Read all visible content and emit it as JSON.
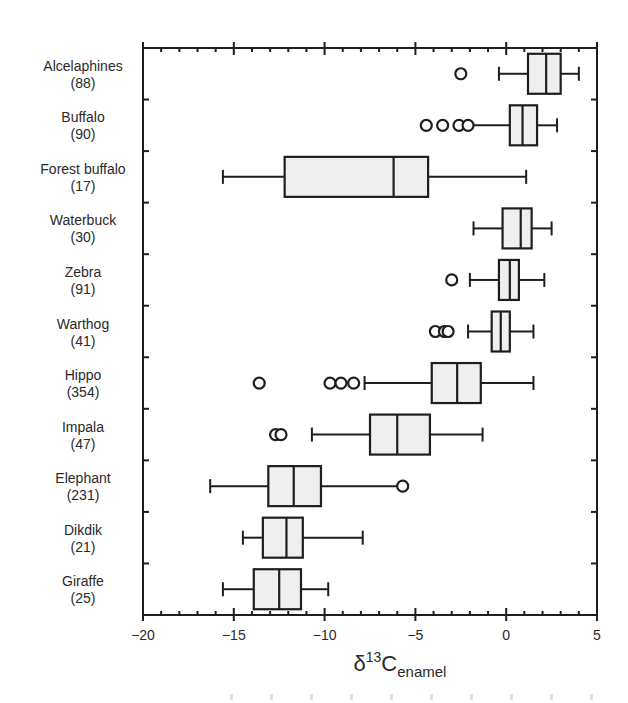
{
  "chart_data": {
    "type": "boxplot",
    "orientation": "horizontal",
    "title": "",
    "xlabel": {
      "main": "δ",
      "sup": "13",
      "base": "C",
      "sub": "enamel"
    },
    "ylabel": "",
    "xlim": [
      -20,
      5
    ],
    "xticks": [
      -20,
      -15,
      -10,
      -5,
      0,
      5
    ],
    "xtick_labels": [
      "−20",
      "−15",
      "−10",
      "−5",
      "0",
      "5"
    ],
    "minor_tick_step": 1,
    "grid": false,
    "legend": null,
    "categories": [
      {
        "name": "Alcelaphines",
        "n": "(88)",
        "whisker_low": -0.4,
        "q1": 1.2,
        "median": 2.2,
        "q3": 3.0,
        "whisker_high": 4.0,
        "outliers": [
          -2.5
        ]
      },
      {
        "name": "Buffalo",
        "n": "(90)",
        "whisker_low": -2.1,
        "q1": 0.2,
        "median": 0.9,
        "q3": 1.7,
        "whisker_high": 2.8,
        "outliers": [
          -4.4,
          -3.5,
          -2.6,
          -2.1
        ]
      },
      {
        "name": "Forest buffalo",
        "n": "(17)",
        "whisker_low": -15.6,
        "q1": -12.2,
        "median": -6.2,
        "q3": -4.3,
        "whisker_high": 1.1,
        "outliers": []
      },
      {
        "name": "Waterbuck",
        "n": "(30)",
        "whisker_low": -1.8,
        "q1": -0.2,
        "median": 0.8,
        "q3": 1.4,
        "whisker_high": 2.5,
        "outliers": []
      },
      {
        "name": "Zebra",
        "n": "(91)",
        "whisker_low": -2.0,
        "q1": -0.4,
        "median": 0.2,
        "q3": 0.7,
        "whisker_high": 2.1,
        "outliers": [
          -3.0
        ]
      },
      {
        "name": "Warthog",
        "n": "(41)",
        "whisker_low": -2.1,
        "q1": -0.8,
        "median": -0.3,
        "q3": 0.2,
        "whisker_high": 1.5,
        "outliers": [
          -3.9,
          -3.4,
          -3.2
        ]
      },
      {
        "name": "Hippo",
        "n": "(354)",
        "whisker_low": -7.8,
        "q1": -4.1,
        "median": -2.7,
        "q3": -1.4,
        "whisker_high": 1.5,
        "outliers": [
          -13.6,
          -9.7,
          -9.1,
          -8.4
        ]
      },
      {
        "name": "Impala",
        "n": "(47)",
        "whisker_low": -10.7,
        "q1": -7.5,
        "median": -6.0,
        "q3": -4.2,
        "whisker_high": -1.3,
        "outliers": [
          -12.7,
          -12.4
        ]
      },
      {
        "name": "Elephant",
        "n": "(231)",
        "whisker_low": -16.3,
        "q1": -13.1,
        "median": -11.7,
        "q3": -10.2,
        "whisker_high": -5.8,
        "outliers": [
          -5.7
        ]
      },
      {
        "name": "Dikdik",
        "n": "(21)",
        "whisker_low": -14.5,
        "q1": -13.4,
        "median": -12.1,
        "q3": -11.2,
        "whisker_high": -7.9,
        "outliers": []
      },
      {
        "name": "Giraffe",
        "n": "(25)",
        "whisker_low": -15.6,
        "q1": -13.9,
        "median": -12.5,
        "q3": -11.3,
        "whisker_high": -9.8,
        "outliers": []
      }
    ]
  },
  "colors": {
    "box_fill": "#efefef",
    "line": "#1e1e1e",
    "text": "#2a2a2a",
    "background": "#ffffff"
  }
}
